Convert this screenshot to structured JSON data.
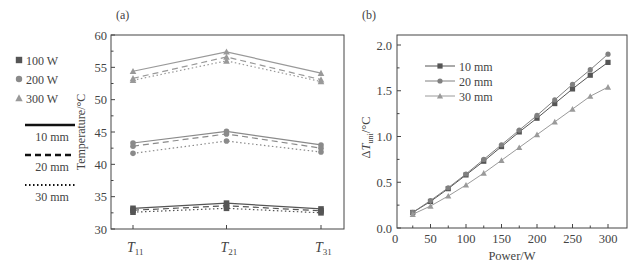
{
  "legend_left": {
    "power_items": [
      {
        "label": "100 W",
        "marker": "square"
      },
      {
        "label": "200 W",
        "marker": "circle"
      },
      {
        "label": "300 W",
        "marker": "triangle"
      }
    ],
    "line_items": [
      {
        "label": "10 mm",
        "style": "solid"
      },
      {
        "label": "20 mm",
        "style": "dashed"
      },
      {
        "label": "30 mm",
        "style": "dotted"
      }
    ]
  },
  "chart_data": [
    {
      "panel": "(a)",
      "type": "line",
      "ylabel": "Temperature/°C",
      "xlabel": "",
      "categories": [
        "T11",
        "T21",
        "T31"
      ],
      "category_display": [
        {
          "main": "T",
          "sub": "11"
        },
        {
          "main": "T",
          "sub": "21"
        },
        {
          "main": "T",
          "sub": "31"
        }
      ],
      "ylim": [
        30,
        60
      ],
      "yticks": [
        30,
        35,
        40,
        45,
        50,
        55,
        60
      ],
      "series": [
        {
          "name": "100 W, 10 mm",
          "power": "100 W",
          "spacing": "10 mm",
          "marker": "square",
          "values": [
            33.2,
            34.0,
            33.1
          ]
        },
        {
          "name": "100 W, 20 mm",
          "power": "100 W",
          "spacing": "20 mm",
          "marker": "square",
          "values": [
            32.9,
            33.6,
            32.8
          ]
        },
        {
          "name": "100 W, 30 mm",
          "power": "100 W",
          "spacing": "30 mm",
          "marker": "square",
          "values": [
            32.6,
            33.2,
            32.5
          ]
        },
        {
          "name": "200 W, 10 mm",
          "power": "200 W",
          "spacing": "10 mm",
          "marker": "circle",
          "values": [
            43.3,
            45.1,
            43.0
          ]
        },
        {
          "name": "200 W, 20 mm",
          "power": "200 W",
          "spacing": "20 mm",
          "marker": "circle",
          "values": [
            42.8,
            44.7,
            42.5
          ]
        },
        {
          "name": "200 W, 30 mm",
          "power": "200 W",
          "spacing": "30 mm",
          "marker": "circle",
          "values": [
            41.7,
            43.6,
            41.9
          ]
        },
        {
          "name": "300 W, 10 mm",
          "power": "300 W",
          "spacing": "10 mm",
          "marker": "triangle",
          "values": [
            54.4,
            57.4,
            54.1
          ]
        },
        {
          "name": "300 W, 20 mm",
          "power": "300 W",
          "spacing": "20 mm",
          "marker": "triangle",
          "values": [
            53.3,
            56.6,
            53.1
          ]
        },
        {
          "name": "300 W, 30 mm",
          "power": "300 W",
          "spacing": "30 mm",
          "marker": "triangle",
          "values": [
            53.0,
            56.0,
            52.8
          ]
        }
      ],
      "grid": false
    },
    {
      "panel": "(b)",
      "type": "line",
      "xlabel": "Power/W",
      "ylabel": "ΔT_uni/°C",
      "xlim": [
        0,
        325
      ],
      "ylim": [
        0,
        2.1
      ],
      "xticks": [
        0,
        50,
        100,
        150,
        200,
        250,
        300
      ],
      "yticks": [
        0.0,
        0.5,
        1.0,
        1.5,
        2.0
      ],
      "x": [
        25,
        50,
        75,
        100,
        125,
        150,
        175,
        200,
        225,
        250,
        275,
        300
      ],
      "series": [
        {
          "name": "10 mm",
          "marker": "square",
          "color": "#555555",
          "values": [
            0.17,
            0.29,
            0.43,
            0.58,
            0.73,
            0.89,
            1.05,
            1.2,
            1.36,
            1.52,
            1.67,
            1.81
          ]
        },
        {
          "name": "20 mm",
          "marker": "circle",
          "color": "#808080",
          "values": [
            0.17,
            0.3,
            0.44,
            0.59,
            0.75,
            0.91,
            1.07,
            1.23,
            1.4,
            1.57,
            1.73,
            1.9
          ]
        },
        {
          "name": "30 mm",
          "marker": "triangle",
          "color": "#9a9a9a",
          "values": [
            0.15,
            0.24,
            0.35,
            0.47,
            0.6,
            0.74,
            0.88,
            1.02,
            1.16,
            1.3,
            1.44,
            1.54
          ]
        }
      ],
      "legend_position": "upper left inside",
      "grid": false
    }
  ],
  "colors": {
    "axis": "#444444",
    "w100": "#555555",
    "w200": "#8a8a8a",
    "w300": "#999999"
  }
}
